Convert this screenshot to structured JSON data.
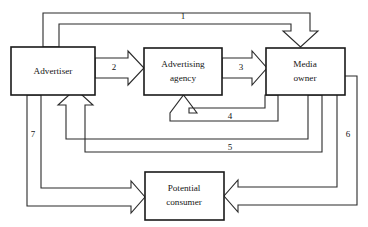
{
  "diagram": {
    "background_color": "#ffffff",
    "line_color": "#2b2b2b",
    "box_border_color": "#1a1a1a",
    "text_color": "#151515",
    "nodes": [
      {
        "id": "advertiser",
        "label": "Advertiser",
        "x": 11,
        "y": 47,
        "w": 84,
        "h": 48
      },
      {
        "id": "advertising-agency",
        "label": "Advertising\nagency",
        "line1": "Advertising",
        "line2": "agency",
        "x": 144,
        "y": 48,
        "w": 78,
        "h": 47
      },
      {
        "id": "media-owner",
        "label": "Media\nowner",
        "line1": "Media",
        "line2": "owner",
        "x": 266,
        "y": 48,
        "w": 79,
        "h": 47
      },
      {
        "id": "potential-consumer",
        "label": "Potential\nconsumer",
        "line1": "Potential",
        "line2": "consumer",
        "x": 145,
        "y": 172,
        "w": 79,
        "h": 48
      }
    ],
    "edges": [
      {
        "id": "edge-1",
        "label": "1",
        "label_x": 183,
        "label_y": 17,
        "from": "advertiser",
        "to": "media-owner"
      },
      {
        "id": "edge-2",
        "label": "2",
        "label_x": 114,
        "label_y": 69,
        "from": "advertiser",
        "to": "advertising-agency"
      },
      {
        "id": "edge-3",
        "label": "3",
        "label_x": 242,
        "label_y": 69,
        "from": "advertising-agency",
        "to": "media-owner"
      },
      {
        "id": "edge-4",
        "label": "4",
        "label_x": 230,
        "label_y": 117,
        "from": "media-owner",
        "to": "advertising-agency"
      },
      {
        "id": "edge-5",
        "label": "5",
        "label_x": 230,
        "label_y": 148,
        "from": "media-owner",
        "to": "advertiser"
      },
      {
        "id": "edge-6",
        "label": "6",
        "label_x": 348,
        "label_y": 135,
        "from": "media-owner",
        "to": "potential-consumer"
      },
      {
        "id": "edge-7",
        "label": "7",
        "label_x": 33,
        "label_y": 135,
        "from": "advertiser",
        "to": "potential-consumer"
      }
    ]
  }
}
